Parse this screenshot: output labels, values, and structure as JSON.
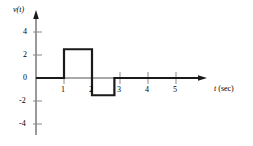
{
  "figure": {
    "ylabel": "v(t)",
    "xlabel": "t",
    "xunit": "(sec)",
    "background_color": "#ffffff",
    "line_color": "#1a1a1a",
    "axis_color": "#555555"
  },
  "axes": {
    "x_ticks": [
      "1",
      "2",
      "3",
      "4",
      "5"
    ],
    "y_ticks": [
      "4",
      "2",
      "0",
      "-2",
      "-4"
    ]
  },
  "chart_data": {
    "type": "line",
    "title": "",
    "xlabel": "t (sec)",
    "ylabel": "v(t)",
    "xlim": [
      0,
      5.9
    ],
    "ylim": [
      -4.9,
      4.6
    ],
    "x_ticks": [
      1,
      2,
      3,
      4,
      5
    ],
    "y_ticks": [
      4,
      2,
      0,
      -2,
      -4
    ],
    "grid": false,
    "legend": null,
    "series": [
      {
        "name": "v(t)",
        "x": [
          0,
          1,
          1,
          2,
          2,
          2.8,
          2.8,
          5.9
        ],
        "y": [
          0,
          0,
          2.5,
          2.5,
          -1.5,
          -1.5,
          0,
          0
        ]
      }
    ]
  }
}
